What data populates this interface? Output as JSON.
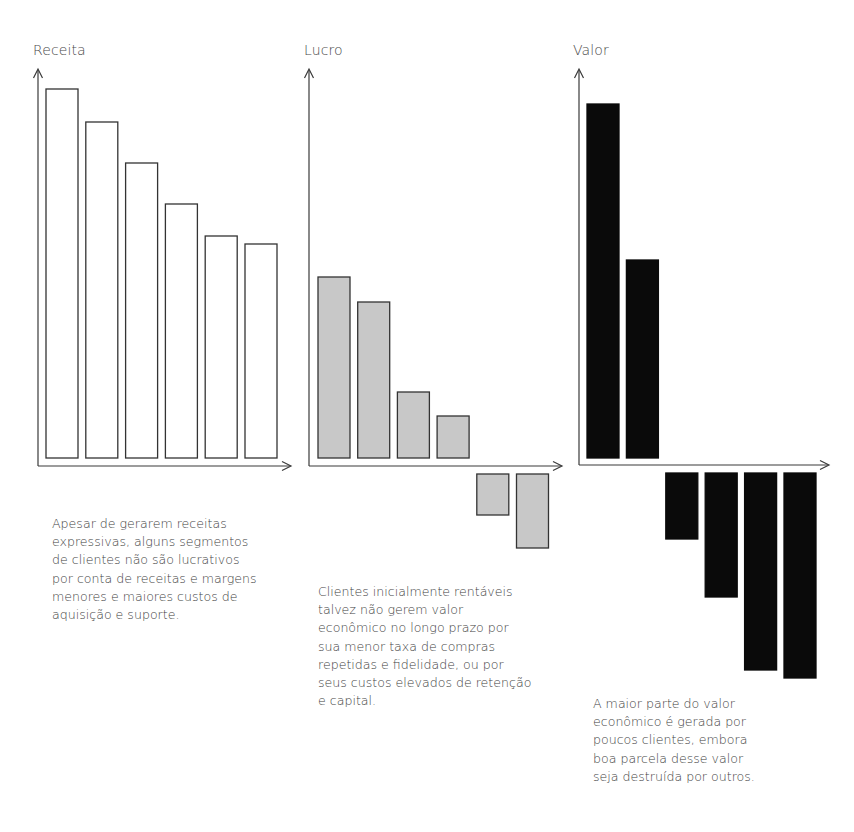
{
  "chart_data": [
    {
      "type": "bar",
      "title": "Receita",
      "categories": [
        "S1",
        "S2",
        "S3",
        "S4",
        "S5",
        "S6"
      ],
      "values": [
        369,
        336,
        295,
        254,
        222,
        214
      ],
      "xlabel": "",
      "ylabel": "Receita",
      "ylim": [
        0,
        390
      ],
      "grid": false,
      "bar_style": {
        "fill": "#ffffff",
        "stroke": "#333333"
      },
      "tick_labels": false
    },
    {
      "type": "bar",
      "title": "Lucro",
      "categories": [
        "S1",
        "S2",
        "S3",
        "S4",
        "S5",
        "S6"
      ],
      "values": [
        181,
        156,
        66,
        42,
        -41,
        -74
      ],
      "xlabel": "",
      "ylabel": "Lucro",
      "ylim": [
        -90,
        390
      ],
      "grid": false,
      "bar_style": {
        "fill": "#c8c8c8",
        "stroke": "#333333"
      },
      "tick_labels": false
    },
    {
      "type": "bar",
      "title": "Valor",
      "categories": [
        "S1",
        "S2",
        "S3",
        "S4",
        "S5",
        "S6"
      ],
      "values": [
        354,
        198,
        -66,
        -124,
        -197,
        -205
      ],
      "xlabel": "",
      "ylabel": "Valor",
      "ylim": [
        -215,
        390
      ],
      "grid": false,
      "bar_style": {
        "fill": "#0a0a0a",
        "stroke": "#0a0a0a"
      },
      "tick_labels": false
    }
  ],
  "panels": [
    {
      "title": "Receita",
      "caption": [
        "Apesar de gerarem receitas",
        "expressivas, alguns segmentos",
        "de clientes não são lucrativos",
        "por conta de receitas e margens",
        "menores e maiores custos de",
        "aquisição e suporte."
      ]
    },
    {
      "title": "Lucro",
      "caption": [
        "Clientes inicialmente rentáveis",
        "talvez não gerem valor",
        "econômico no longo prazo por",
        "sua menor taxa de compras",
        "repetidas e fidelidade, ou por",
        "seus custos elevados de retenção",
        "e capital."
      ]
    },
    {
      "title": "Valor",
      "caption": [
        "A maior parte do valor",
        "econômico é gerada por",
        "poucos clientes, embora",
        "boa parcela desse valor",
        "seja destruída por outros."
      ]
    }
  ],
  "colors": {
    "axis": "#3a3a3a",
    "receita_fill": "#ffffff",
    "lucro_fill": "#c8c8c8",
    "valor_fill": "#0a0a0a",
    "text": "#3f3f3f"
  }
}
